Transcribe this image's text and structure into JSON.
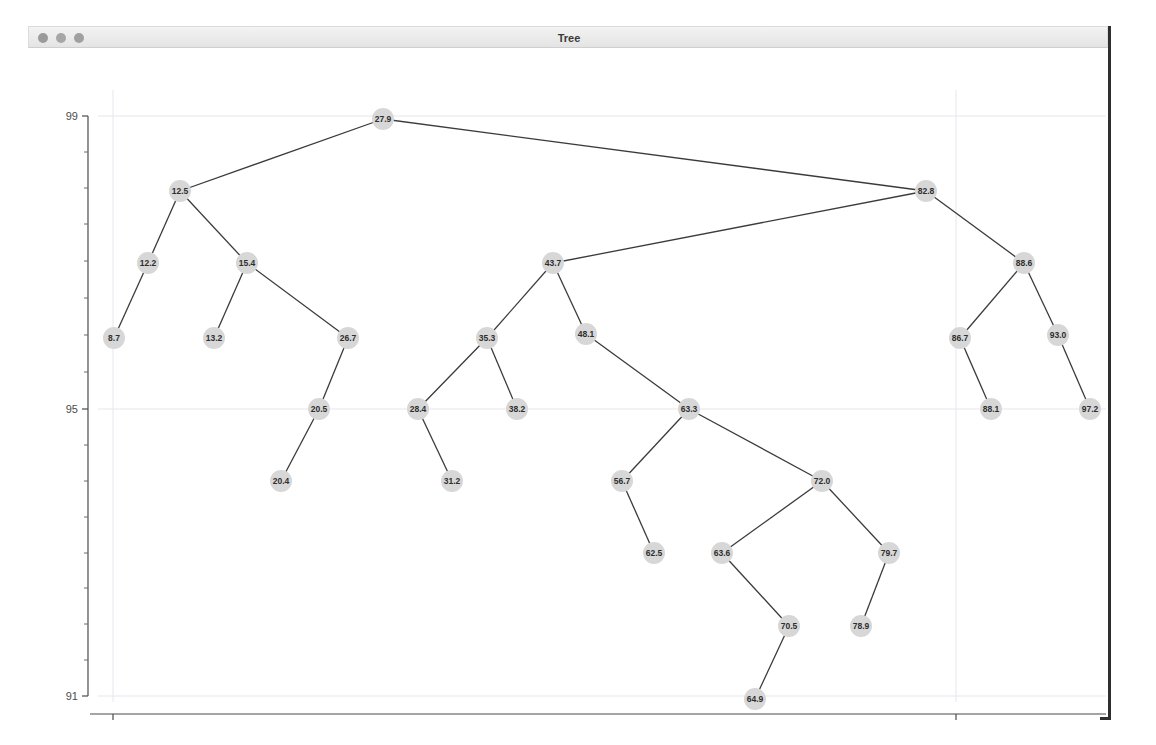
{
  "window": {
    "title": "Tree",
    "traffic_lights": [
      "close",
      "minimize",
      "zoom"
    ]
  },
  "chart_data": {
    "type": "tree",
    "title": "Tree",
    "xlabel": "",
    "ylabel": "",
    "grid": true,
    "x_ticks": [
      {
        "label": "0.00",
        "px": 85
      },
      {
        "label": "25.00",
        "px": 928
      }
    ],
    "y_ticks": [
      {
        "label": "99",
        "px": 68
      },
      {
        "label": "95",
        "px": 361
      },
      {
        "label": "91",
        "px": 648
      }
    ],
    "y_minor_ticks_px": [
      104,
      140,
      176,
      213,
      250,
      287,
      324,
      397,
      433,
      469,
      505,
      540,
      576,
      612
    ],
    "xlim": [
      0,
      25
    ],
    "ylim": [
      91,
      99
    ],
    "node_fill": "#d7d7d7",
    "edge_color": "#3b3b3b",
    "grid_color": "#e6e6ef",
    "node_radius": 11,
    "nodes": [
      {
        "id": "n0",
        "label": "27.9",
        "x": 355,
        "y": 71
      },
      {
        "id": "n1",
        "label": "12.5",
        "x": 152,
        "y": 143
      },
      {
        "id": "n2",
        "label": "82.8",
        "x": 898,
        "y": 143
      },
      {
        "id": "n3",
        "label": "12.2",
        "x": 120,
        "y": 215
      },
      {
        "id": "n4",
        "label": "15.4",
        "x": 219,
        "y": 215
      },
      {
        "id": "n5",
        "label": "43.7",
        "x": 525,
        "y": 215
      },
      {
        "id": "n6",
        "label": "88.6",
        "x": 996,
        "y": 215
      },
      {
        "id": "n7",
        "label": "8.7",
        "x": 86,
        "y": 290
      },
      {
        "id": "n8",
        "label": "13.2",
        "x": 186,
        "y": 290
      },
      {
        "id": "n9",
        "label": "26.7",
        "x": 320,
        "y": 290
      },
      {
        "id": "n10",
        "label": "35.3",
        "x": 459,
        "y": 290
      },
      {
        "id": "n11",
        "label": "48.1",
        "x": 558,
        "y": 286
      },
      {
        "id": "n12",
        "label": "86.7",
        "x": 932,
        "y": 290
      },
      {
        "id": "n13",
        "label": "93.0",
        "x": 1030,
        "y": 287
      },
      {
        "id": "n14",
        "label": "20.5",
        "x": 291,
        "y": 361
      },
      {
        "id": "n15",
        "label": "28.4",
        "x": 390,
        "y": 361
      },
      {
        "id": "n16",
        "label": "38.2",
        "x": 489,
        "y": 361
      },
      {
        "id": "n17",
        "label": "63.3",
        "x": 661,
        "y": 361
      },
      {
        "id": "n18",
        "label": "88.1",
        "x": 963,
        "y": 361
      },
      {
        "id": "n19",
        "label": "97.2",
        "x": 1062,
        "y": 361
      },
      {
        "id": "n20",
        "label": "20.4",
        "x": 253,
        "y": 433
      },
      {
        "id": "n21",
        "label": "31.2",
        "x": 424,
        "y": 433
      },
      {
        "id": "n22",
        "label": "56.7",
        "x": 594,
        "y": 433
      },
      {
        "id": "n23",
        "label": "72.0",
        "x": 794,
        "y": 433
      },
      {
        "id": "n24",
        "label": "62.5",
        "x": 626,
        "y": 505
      },
      {
        "id": "n25",
        "label": "63.6",
        "x": 694,
        "y": 505
      },
      {
        "id": "n26",
        "label": "79.7",
        "x": 861,
        "y": 505
      },
      {
        "id": "n27",
        "label": "70.5",
        "x": 761,
        "y": 578
      },
      {
        "id": "n28",
        "label": "78.9",
        "x": 833,
        "y": 578
      },
      {
        "id": "n29",
        "label": "64.9",
        "x": 727,
        "y": 651
      }
    ],
    "edges": [
      [
        "n0",
        "n1"
      ],
      [
        "n0",
        "n2"
      ],
      [
        "n1",
        "n3"
      ],
      [
        "n1",
        "n4"
      ],
      [
        "n2",
        "n5"
      ],
      [
        "n2",
        "n6"
      ],
      [
        "n3",
        "n7"
      ],
      [
        "n4",
        "n8"
      ],
      [
        "n4",
        "n9"
      ],
      [
        "n5",
        "n10"
      ],
      [
        "n5",
        "n11"
      ],
      [
        "n6",
        "n12"
      ],
      [
        "n6",
        "n13"
      ],
      [
        "n9",
        "n14"
      ],
      [
        "n10",
        "n15"
      ],
      [
        "n10",
        "n16"
      ],
      [
        "n11",
        "n17"
      ],
      [
        "n12",
        "n18"
      ],
      [
        "n13",
        "n19"
      ],
      [
        "n14",
        "n20"
      ],
      [
        "n15",
        "n21"
      ],
      [
        "n17",
        "n22"
      ],
      [
        "n17",
        "n23"
      ],
      [
        "n22",
        "n24"
      ],
      [
        "n23",
        "n25"
      ],
      [
        "n23",
        "n26"
      ],
      [
        "n25",
        "n27"
      ],
      [
        "n26",
        "n28"
      ],
      [
        "n27",
        "n29"
      ]
    ]
  }
}
